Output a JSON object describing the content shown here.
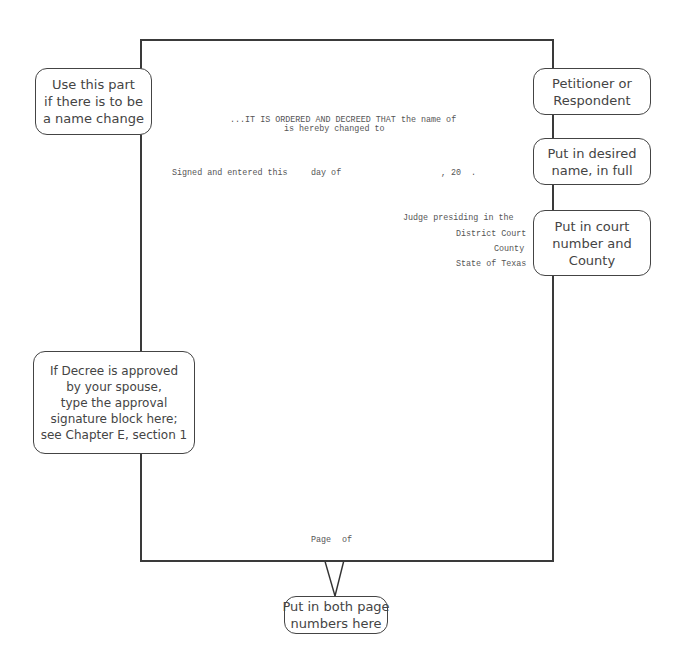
{
  "document": {
    "order_line_1": "...IT IS ORDERED AND DECREED THAT the name of",
    "order_line_2": "is hereby changed to",
    "signed_line": {
      "prefix": "Signed and entered this",
      "day_of": "day of",
      "year_prefix": ", 20"
    },
    "signature_block": {
      "judge": "Judge presiding in the",
      "court": "District Court",
      "county": "County",
      "state": "State of Texas"
    },
    "footer": {
      "page": "Page",
      "of": "of"
    }
  },
  "callouts": {
    "name_change": [
      "Use this part",
      "if there is to be",
      "a name change"
    ],
    "petitioner": [
      "Petitioner or",
      "Respondent"
    ],
    "desired_name": [
      "Put in desired",
      "name, in full"
    ],
    "court_number": [
      "Put in court",
      "number and",
      "County"
    ],
    "approval": [
      "If Decree is approved",
      "by your spouse,",
      "type the approval",
      "signature block here;",
      "see Chapter E, section 1"
    ],
    "page_numbers": [
      "Put in both page",
      "numbers here"
    ]
  },
  "colors": {
    "border": "#3a3a3a",
    "text": "#555555",
    "callout_border": "#444444"
  }
}
